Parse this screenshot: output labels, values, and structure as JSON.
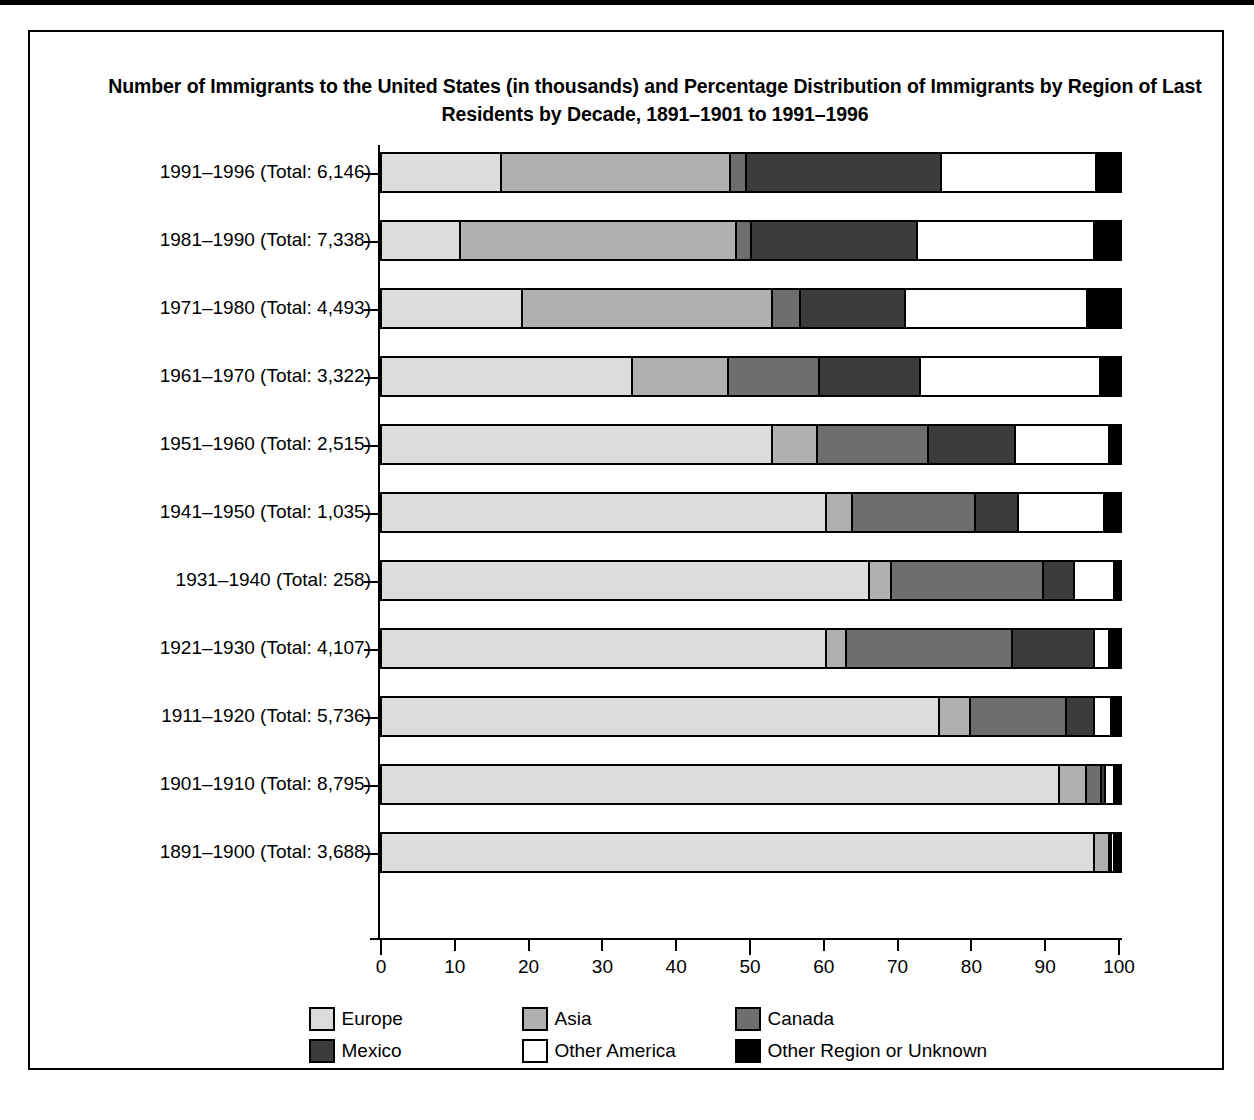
{
  "figure": {
    "title": "Number of Immigrants to the United States (in thousands) and Percentage Distribution of Immigrants by Region of Last Residents by Decade, 1891–1901 to 1991–1996"
  },
  "legend": {
    "items": [
      {
        "label": "Europe",
        "color": "#dcdcdc"
      },
      {
        "label": "Asia",
        "color": "#b0b0b0"
      },
      {
        "label": "Canada",
        "color": "#6e6e6e"
      },
      {
        "label": "Mexico",
        "color": "#3c3c3c"
      },
      {
        "label": "Other America",
        "color": "#ffffff"
      },
      {
        "label": "Other Region or Unknown",
        "color": "#000000"
      }
    ]
  },
  "chart_data": {
    "type": "bar",
    "orientation": "horizontal",
    "stacked": true,
    "stack_mode": "percent",
    "title": "Number of Immigrants to the United States (in thousands) and Percentage Distribution of Immigrants by Region of Last Residents by Decade, 1891–1901 to 1991–1996",
    "xlabel": "",
    "ylabel": "",
    "xlim": [
      0,
      100
    ],
    "xticks": [
      0,
      10,
      20,
      30,
      40,
      50,
      60,
      70,
      80,
      90,
      100
    ],
    "xticklabels": [
      "0",
      "10",
      "20",
      "30",
      "40",
      "50",
      "60",
      "70",
      "80",
      "90",
      "100"
    ],
    "grid": false,
    "legend_position": "bottom",
    "categories": [
      "1991–1996 (Total: 6,146)",
      "1981–1990 (Total: 7,338)",
      "1971–1980 (Total: 4,493)",
      "1961–1970 (Total: 3,322)",
      "1951–1960 (Total: 2,515)",
      "1941–1950 (Total: 1,035)",
      "1931–1940 (Total:   258)",
      "1921–1930 (Total: 4,107)",
      "1911–1920 (Total: 5,736)",
      "1901–1910 (Total: 8,795)",
      "1891–1900 (Total: 3,688)"
    ],
    "totals_thousands": [
      6146,
      7338,
      4493,
      3322,
      2515,
      1035,
      258,
      4107,
      5736,
      8795,
      3688
    ],
    "series": [
      {
        "name": "Europe",
        "values": [
          16.0,
          10.5,
          18.8,
          33.8,
          52.7,
          60.0,
          65.8,
          60.0,
          75.3,
          91.6,
          96.4
        ]
      },
      {
        "name": "Asia",
        "values": [
          31.0,
          37.4,
          33.9,
          12.9,
          6.1,
          3.6,
          3.1,
          2.7,
          4.3,
          3.7,
          2.0
        ]
      },
      {
        "name": "Canada",
        "values": [
          2.2,
          1.9,
          3.8,
          12.4,
          15.0,
          16.6,
          20.5,
          22.5,
          12.9,
          2.0,
          0.1
        ]
      },
      {
        "name": "Mexico",
        "values": [
          26.4,
          22.6,
          14.2,
          13.7,
          11.9,
          5.9,
          4.2,
          11.2,
          3.8,
          0.6,
          0.0
        ]
      },
      {
        "name": "Other America",
        "values": [
          21.0,
          24.0,
          24.7,
          24.4,
          12.7,
          11.6,
          5.4,
          2.0,
          2.3,
          1.1,
          0.4
        ]
      },
      {
        "name": "Other Region or Unknown",
        "values": [
          3.4,
          3.6,
          4.6,
          2.8,
          1.6,
          2.3,
          1.0,
          1.6,
          1.4,
          1.0,
          1.1
        ]
      }
    ]
  }
}
